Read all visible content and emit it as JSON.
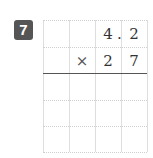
{
  "problem": {
    "number": "7",
    "multiplicand": [
      "",
      "",
      "4",
      "2"
    ],
    "multiplier": [
      "",
      "×",
      "2",
      "7"
    ],
    "decimal_point": ".",
    "empty_rows": 3
  }
}
